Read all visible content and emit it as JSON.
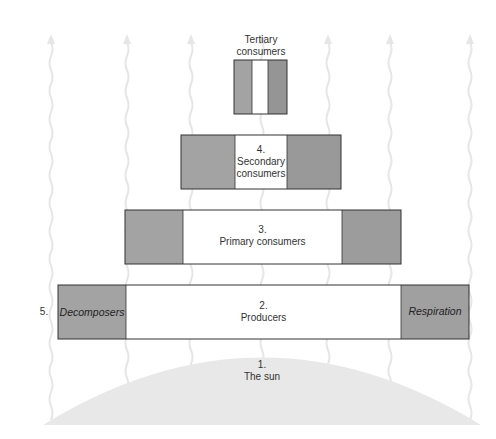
{
  "diagram": {
    "colors": {
      "side_gray_left": "#a3a3a3",
      "side_gray_right": "#9c9c9c",
      "center_white": "#ffffff",
      "border": "#333333",
      "sun": "#e8e8e8",
      "arrows": "#e6e6e6"
    },
    "levels": [
      {
        "id": "sun",
        "number": "1.",
        "label": "The sun"
      },
      {
        "id": "producers",
        "number": "2.",
        "label": "Producers"
      },
      {
        "id": "primary",
        "number": "3.",
        "label": "Primary consumers"
      },
      {
        "id": "secondary",
        "number": "4.",
        "label_line1": "Secondary",
        "label_line2": "consumers"
      },
      {
        "id": "tertiary",
        "label_line1": "Tertiary",
        "label_line2": "consumers"
      }
    ],
    "side_labels": {
      "left_number": "5.",
      "left": "Decomposers",
      "right": "Respiration"
    },
    "arrow_icon": "heat-loss-wavy-arrow"
  }
}
